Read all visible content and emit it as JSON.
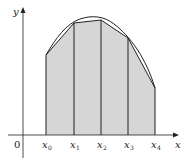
{
  "diagram": {
    "axes": {
      "x_label": "x",
      "y_label": "y",
      "origin_label": "0"
    },
    "partition_labels": [
      {
        "base": "x",
        "sub": "0"
      },
      {
        "base": "x",
        "sub": "1"
      },
      {
        "base": "x",
        "sub": "2"
      },
      {
        "base": "x",
        "sub": "3"
      },
      {
        "base": "x",
        "sub": "4"
      }
    ],
    "colors": {
      "fill": "#d6d6d6",
      "stroke": "#222222",
      "background": "#ffffff"
    }
  }
}
